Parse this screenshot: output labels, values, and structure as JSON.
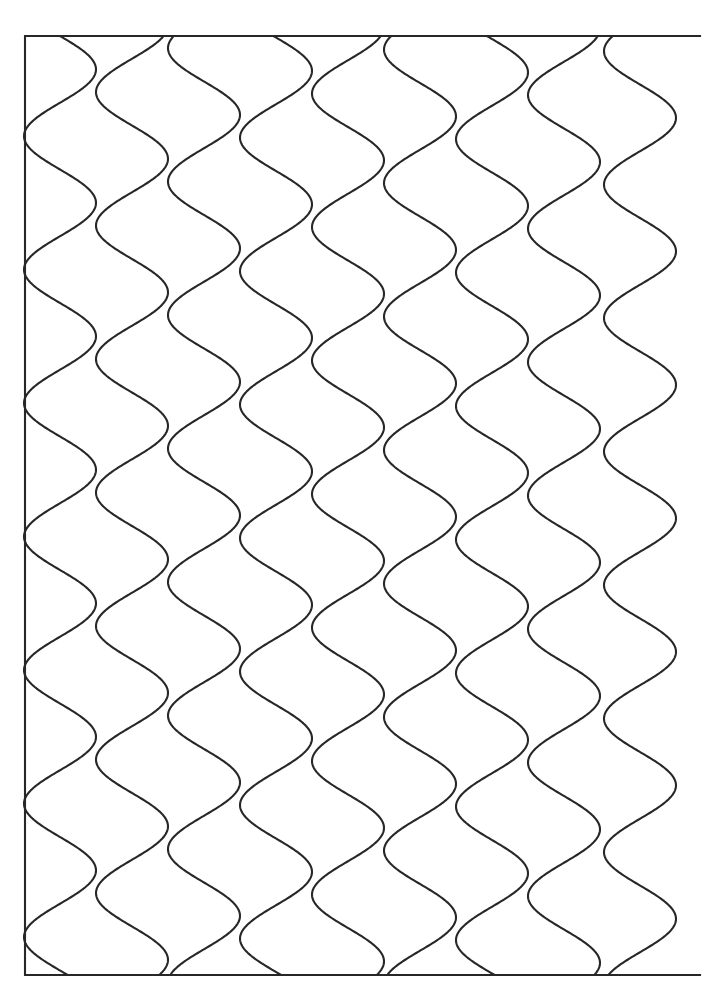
{
  "document": {
    "title": "Wavy Lines Pattern",
    "type": "line-art-coloring-page",
    "width": 709,
    "height": 986,
    "background_color": "#ffffff",
    "ink_color": "#272727",
    "stroke_width": 2.1,
    "text_content": "",
    "caption": ""
  },
  "frame": {
    "name": "drawing-border",
    "left": 25,
    "top": 36,
    "right": 700,
    "bottom": 975,
    "sides_drawn": [
      "top",
      "left",
      "bottom"
    ],
    "right_side_note": "right edge is formed by the last wave line, no straight border",
    "color": "#272727"
  },
  "pattern": {
    "name": "vertical-s-curve-wave-grid",
    "description": "Interlocking vertical sinusoidal S-curves forming a scale-like repeating pattern",
    "line_count": 9,
    "orientation": "vertical",
    "amplitude_px": 36,
    "vertical_period_px": 133.5,
    "horizontal_spacing_px": 72,
    "first_line_center_x": 60,
    "phase_shift_per_line_px": 44,
    "top_y": 36,
    "bottom_y": 975,
    "vertical_cycles": 7.03,
    "lines": [
      {
        "index": 0,
        "center_x": 60,
        "phase_offset_px": 0
      },
      {
        "index": 1,
        "center_x": 132,
        "phase_offset_px": 44
      },
      {
        "index": 2,
        "center_x": 204,
        "phase_offset_px": 88
      },
      {
        "index": 3,
        "center_x": 276,
        "phase_offset_px": 132
      },
      {
        "index": 4,
        "center_x": 348,
        "phase_offset_px": 176
      },
      {
        "index": 5,
        "center_x": 420,
        "phase_offset_px": 220
      },
      {
        "index": 6,
        "center_x": 492,
        "phase_offset_px": 264
      },
      {
        "index": 7,
        "center_x": 564,
        "phase_offset_px": 308
      },
      {
        "index": 8,
        "center_x": 640,
        "phase_offset_px": 352
      }
    ]
  },
  "chart_data": {
    "type": "line",
    "title": "Wavy Lines Pattern",
    "xlabel": "",
    "ylabel": "",
    "xlim": [
      25,
      700
    ],
    "ylim": [
      36,
      975
    ],
    "grid": false,
    "legend": null,
    "annotations": [],
    "series": [
      {
        "name": "wave-1",
        "center_x": 60,
        "amplitude": 36,
        "period": 133.5,
        "phase": 0
      },
      {
        "name": "wave-2",
        "center_x": 132,
        "amplitude": 36,
        "period": 133.5,
        "phase": 44
      },
      {
        "name": "wave-3",
        "center_x": 204,
        "amplitude": 36,
        "period": 133.5,
        "phase": 88
      },
      {
        "name": "wave-4",
        "center_x": 276,
        "amplitude": 36,
        "period": 133.5,
        "phase": 132
      },
      {
        "name": "wave-5",
        "center_x": 348,
        "amplitude": 36,
        "period": 133.5,
        "phase": 176
      },
      {
        "name": "wave-6",
        "center_x": 420,
        "amplitude": 36,
        "period": 133.5,
        "phase": 220
      },
      {
        "name": "wave-7",
        "center_x": 492,
        "amplitude": 36,
        "period": 133.5,
        "phase": 264
      },
      {
        "name": "wave-8",
        "center_x": 564,
        "amplitude": 36,
        "period": 133.5,
        "phase": 308
      },
      {
        "name": "wave-9",
        "center_x": 640,
        "amplitude": 36,
        "period": 133.5,
        "phase": 352
      }
    ]
  }
}
